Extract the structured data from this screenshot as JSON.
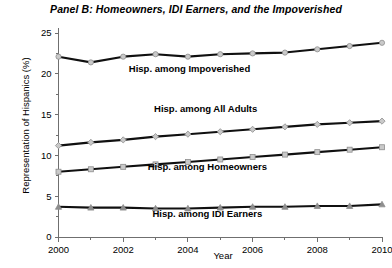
{
  "chart_data": {
    "type": "line",
    "title": "Panel B: Homeowners, IDI Earners, and the Impoverished",
    "xlabel": "Year",
    "ylabel": "Representation of Hispanics (%)",
    "x": [
      2000,
      2001,
      2002,
      2003,
      2004,
      2005,
      2006,
      2007,
      2008,
      2009,
      2010
    ],
    "xlim": [
      2000,
      2010
    ],
    "ylim": [
      0,
      25
    ],
    "y_ticks": [
      0,
      5,
      10,
      15,
      20,
      25
    ],
    "y_tick_labels": [
      "0",
      "5",
      "10",
      "15",
      "20",
      "25"
    ],
    "x_ticks": [
      2000,
      2001,
      2002,
      2003,
      2004,
      2005,
      2006,
      2007,
      2008,
      2009,
      2010
    ],
    "x_tick_labels": [
      "2000",
      "",
      "2002",
      "",
      "2004",
      "",
      "2006",
      "",
      "2008",
      "",
      "2010"
    ],
    "x_major_labels": [
      "2000",
      "2002",
      "2004",
      "2006",
      "2008",
      "2010"
    ],
    "grid": false,
    "legend_position": "inline-annotations",
    "series": [
      {
        "name": "Hisp. among Impoverished",
        "label": "Hisp. among Impoverished",
        "marker": "circle",
        "values": [
          22.1,
          21.4,
          22.1,
          22.4,
          22.1,
          22.4,
          22.5,
          22.6,
          23.0,
          23.4,
          23.8
        ],
        "label_x": 2004.05,
        "label_y": 20.2
      },
      {
        "name": "Hisp. among All Adults",
        "label": "Hisp. among All Adults",
        "marker": "diamond",
        "values": [
          11.2,
          11.6,
          11.9,
          12.3,
          12.6,
          12.9,
          13.2,
          13.5,
          13.8,
          14.0,
          14.2
        ],
        "label_x": 2004.55,
        "label_y": 15.3
      },
      {
        "name": "Hisp. among Homeowners",
        "label": "Hisp. among Homeowners",
        "marker": "square",
        "values": [
          8.0,
          8.3,
          8.6,
          8.9,
          9.2,
          9.5,
          9.8,
          10.1,
          10.4,
          10.7,
          11.0
        ],
        "label_x": 2004.6,
        "label_y": 8.2
      },
      {
        "name": "Hisp. among IDI Earners",
        "label": "Hisp. among IDI Earners",
        "marker": "triangle",
        "values": [
          3.7,
          3.6,
          3.6,
          3.5,
          3.5,
          3.6,
          3.7,
          3.7,
          3.8,
          3.8,
          4.0
        ],
        "label_x": 2004.6,
        "label_y": 2.4
      }
    ],
    "colors": {
      "line": "#101010",
      "marker_edge": "#8e8e8e",
      "axis": "#6f6f6f",
      "background": "#ffffff",
      "text": "#000000"
    }
  }
}
